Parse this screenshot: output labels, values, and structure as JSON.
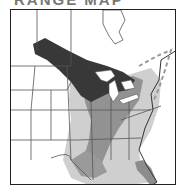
{
  "title": "RANGE MAP",
  "map": {
    "region": "Eastern and central United States with southern Canada",
    "legend_levels": [
      {
        "name": "core-range",
        "color": "#3a3a3a"
      },
      {
        "name": "common-range",
        "color": "#8c8c8c"
      },
      {
        "name": "occasional-range",
        "color": "#c8c8c8"
      }
    ],
    "boundary_line": {
      "style": "dashed",
      "color": "#9a9a9a"
    },
    "border_color": "#555555",
    "water_color": "#ffffff"
  }
}
